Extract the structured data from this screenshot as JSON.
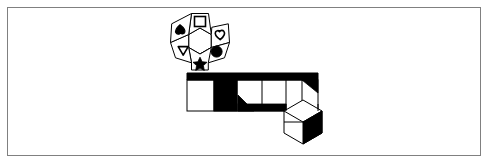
{
  "canvas": {
    "width": 490,
    "height": 165,
    "background_color": "#ffffff",
    "stroke_color": "#000000",
    "fill_color": "#000000",
    "frame": {
      "name": "outer-border",
      "x": 7,
      "y": 7,
      "width": 474,
      "height": 149,
      "border_color": "#808080",
      "border_width": 1
    }
  },
  "diagram": {
    "title": "",
    "rosette": {
      "name": "hexagon-rosette",
      "center_x": 200,
      "center_y": 41,
      "core_radius": 13,
      "petal_count": 6,
      "petals": [
        {
          "position": "top",
          "angle_deg": 270,
          "symbol": "square-icon",
          "symbol_shape": "square",
          "symbol_fill": "outline",
          "label": "Square"
        },
        {
          "position": "upper-right",
          "angle_deg": 330,
          "symbol": "heart-icon",
          "symbol_shape": "heart",
          "symbol_fill": "outline",
          "label": "Heart"
        },
        {
          "position": "lower-right",
          "angle_deg": 30,
          "symbol": "circle-icon",
          "symbol_shape": "circle",
          "symbol_fill": "solid",
          "label": "Circle"
        },
        {
          "position": "bottom",
          "angle_deg": 90,
          "symbol": "star-icon",
          "symbol_shape": "star",
          "symbol_fill": "solid",
          "label": "Star"
        },
        {
          "position": "lower-left",
          "angle_deg": 150,
          "symbol": "triangle-icon",
          "symbol_shape": "triangle",
          "symbol_fill": "outline",
          "label": "Triangle"
        },
        {
          "position": "upper-left",
          "angle_deg": 210,
          "symbol": "spade-icon",
          "symbol_shape": "spade",
          "symbol_fill": "solid",
          "label": "Spade"
        }
      ]
    },
    "strip": {
      "name": "horizontal-band",
      "x": 187,
      "y": 73,
      "width": 131,
      "height": 38,
      "top_bar_height": 7,
      "top_bar_fill": "solid",
      "cells": [
        {
          "index": 0,
          "x": 187,
          "width": 27,
          "fill": "white",
          "label": "Cell 1"
        },
        {
          "index": 1,
          "x": 214,
          "width": 23,
          "fill": "black",
          "label": "Cell 2"
        },
        {
          "index": 2,
          "x": 237,
          "width": 25,
          "fill": "white",
          "accent": "corner-triangle-bottom-left",
          "label": "Cell 3"
        },
        {
          "index": 3,
          "x": 262,
          "width": 24,
          "fill": "white",
          "accent": "bottom-bar",
          "label": "Cell 4"
        },
        {
          "index": 4,
          "x": 286,
          "width": 16,
          "fill": "white",
          "label": "Cell 5"
        },
        {
          "index": 5,
          "x": 302,
          "width": 16,
          "fill": "white",
          "accent": "corner-triangle-top-right",
          "label": "Cell 6"
        }
      ]
    },
    "cube": {
      "name": "hexagon-cube",
      "center_x": 303,
      "center_y": 122,
      "radius": 22,
      "midline": true,
      "lower_right_fill": "solid",
      "lower_left_fill": "white",
      "upper_fill": "white",
      "label": "Cube"
    }
  }
}
